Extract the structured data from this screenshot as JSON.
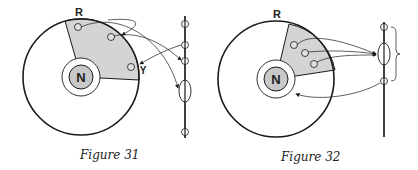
{
  "figures": [
    {
      "caption": "Figure 31",
      "labels": {
        "outer": "R",
        "nucleus": "N",
        "marker": "Y"
      },
      "description": "Circle with shaded sector containing three small circles; arrows connect them to markers on a vertical axis on the right (small circles and one ellipse)."
    },
    {
      "caption": "Figure 32",
      "labels": {
        "outer": "R",
        "nucleus": "N"
      },
      "description": "Circle with shaded sector containing three small circles whose arrows converge on an ellipse on the vertical axis; a brace groups the top three markers; an arrow from the lower marker returns to the nucleus ring."
    }
  ],
  "colors": {
    "line": "#1a1a1a",
    "shade": "#d4d4d4",
    "nucleus": "#c8c8c8",
    "background": "#ffffff"
  }
}
